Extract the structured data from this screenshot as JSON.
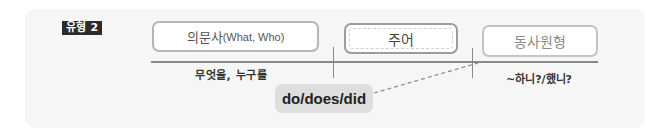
{
  "diagram": {
    "type_tag": "유형 2",
    "boxes": {
      "wh_question": {
        "ko": "의문사",
        "en": "(What, Who)"
      },
      "subject": {
        "label": "주어"
      },
      "base_verb": {
        "label": "동사원형"
      }
    },
    "labels": {
      "wh_meaning": "무엇을, 누구를",
      "verb_meaning": "~하니?/했니?"
    },
    "auxiliary": {
      "label": "do/does/did"
    },
    "colors": {
      "panel_bg": "#f6f6f6",
      "tag_bg": "#2b2b2b",
      "box_border": "#b5b5b5",
      "aux_bg": "#dedede",
      "line": "#8a8a8a"
    }
  }
}
